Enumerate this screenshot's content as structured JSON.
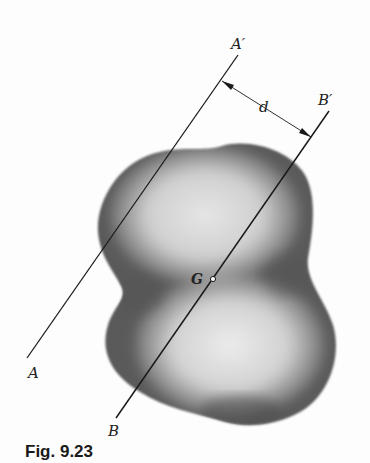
{
  "figure": {
    "caption": "Fig. 9.23",
    "labels": {
      "A": "A",
      "A_prime": "A′",
      "B": "B",
      "B_prime": "B′",
      "d": "d",
      "G": "G"
    },
    "colors": {
      "line": "#1a1a1a",
      "shape_dark": "#4a4a4a",
      "shape_light": "#e0e0e0",
      "background": "#fdfdfd"
    }
  }
}
